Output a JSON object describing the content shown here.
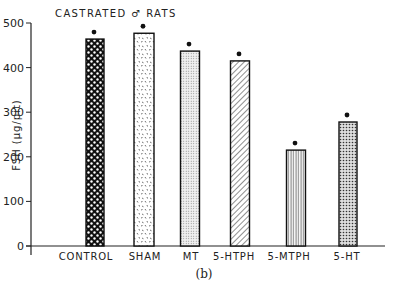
{
  "chart_data": {
    "type": "bar",
    "title": "CASTRATED ♂ RATS",
    "xlabel": "",
    "ylabel": "FSH (μg/pit)",
    "ylim": [
      0,
      500
    ],
    "yticks": [
      0,
      100,
      200,
      300,
      400,
      500
    ],
    "categories": [
      "CONTROL",
      "SHAM",
      "MT",
      "5-HTPH",
      "5-MTPH",
      "5-HT"
    ],
    "values": [
      464,
      477,
      437,
      415,
      215,
      278
    ],
    "annotations": [
      "• marker above each bar"
    ],
    "patterns": [
      "dense crosshatch (checker)",
      "random speckle",
      "fine stipple",
      "diagonal hatch",
      "vertical lines",
      "dense dots"
    ],
    "grid": false,
    "legend": null,
    "caption": "(b)"
  }
}
